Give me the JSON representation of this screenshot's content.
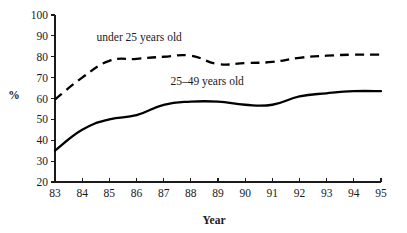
{
  "chart_data": {
    "type": "line",
    "title": "",
    "xlabel": "Year",
    "ylabel": "%",
    "x": [
      "83",
      "84",
      "85",
      "86",
      "87",
      "88",
      "89",
      "90",
      "91",
      "92",
      "93",
      "94",
      "95"
    ],
    "categories": [
      "83",
      "84",
      "85",
      "86",
      "87",
      "88",
      "89",
      "90",
      "91",
      "92",
      "93",
      "94",
      "95"
    ],
    "xlim": [
      83,
      95
    ],
    "ylim": [
      20,
      100
    ],
    "yticks": [
      20,
      30,
      40,
      50,
      60,
      70,
      80,
      90,
      100
    ],
    "xticks": [
      "83",
      "84",
      "85",
      "86",
      "87",
      "88",
      "89",
      "90",
      "91",
      "92",
      "93",
      "94",
      "95"
    ],
    "grid": false,
    "legend_position": "inline-annotation",
    "series": [
      {
        "name": "under 25 years old",
        "style": "dashed",
        "color": "#000000",
        "values": [
          59.5,
          70.0,
          78.0,
          79.0,
          80.0,
          80.5,
          76.5,
          77.0,
          77.5,
          79.5,
          80.5,
          81.0,
          81.0
        ]
      },
      {
        "name": "25–49 years old",
        "style": "solid",
        "color": "#000000",
        "values": [
          35.0,
          45.0,
          50.0,
          52.0,
          57.0,
          58.5,
          58.5,
          57.0,
          57.0,
          61.0,
          62.5,
          63.5,
          63.5
        ]
      }
    ],
    "annotations": [
      {
        "text": "under 25 years old",
        "x": 86.1,
        "y": 87.5
      },
      {
        "text": "25–49 years old",
        "x": 88.6,
        "y": 66.5
      }
    ]
  },
  "axes": {
    "y_title": "%",
    "x_title": "Year"
  }
}
